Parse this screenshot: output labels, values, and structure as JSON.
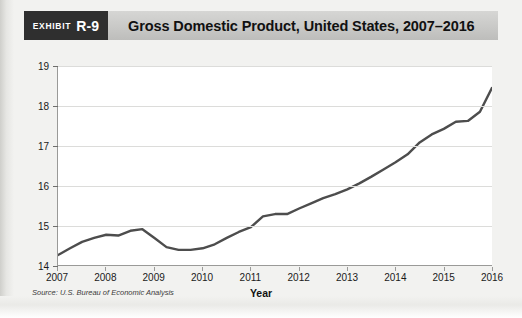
{
  "exhibit": {
    "tag_word": "Exhibit",
    "tag_number": "R-9",
    "title": "Gross Domestic Product, United States, 2007–2016"
  },
  "source_note": "Source: U.S. Bureau of Economic Analysis",
  "colors": {
    "banner_bg": "#c9c9c7",
    "tag_bg": "#2f2f2f",
    "tag_text": "#ffffff",
    "line": "#4d4d4d",
    "grid": "#dcdcda",
    "plot_bg": "#ffffff",
    "page_bg": "#f2f2f0"
  },
  "chart_data": {
    "type": "line",
    "title": "Gross Domestic Product, United States, 2007–2016",
    "xlabel": "Year",
    "ylabel": "Trillions of Dollars",
    "xlim": [
      2007,
      2016
    ],
    "ylim": [
      14,
      19
    ],
    "yticks": [
      14,
      15,
      16,
      17,
      18,
      19
    ],
    "xticks": [
      2007,
      2008,
      2009,
      2010,
      2011,
      2012,
      2013,
      2014,
      2015,
      2016
    ],
    "grid": true,
    "legend": null,
    "series": [
      {
        "name": "Gross Domestic Product",
        "units": "Trillions of Dollars",
        "x": [
          2007.0,
          2007.25,
          2007.5,
          2007.75,
          2008.0,
          2008.25,
          2008.5,
          2008.75,
          2009.0,
          2009.25,
          2009.5,
          2009.75,
          2010.0,
          2010.25,
          2010.5,
          2010.75,
          2011.0,
          2011.25,
          2011.5,
          2011.75,
          2012.0,
          2012.25,
          2012.5,
          2012.75,
          2013.0,
          2013.25,
          2013.5,
          2013.75,
          2014.0,
          2014.25,
          2014.5,
          2014.75,
          2015.0,
          2015.25,
          2015.5,
          2015.75,
          2016.0
        ],
        "values": [
          14.25,
          14.42,
          14.58,
          14.68,
          14.76,
          14.74,
          14.86,
          14.9,
          14.68,
          14.45,
          14.38,
          14.38,
          14.42,
          14.52,
          14.68,
          14.83,
          14.95,
          15.22,
          15.28,
          15.28,
          15.42,
          15.55,
          15.68,
          15.78,
          15.9,
          16.05,
          16.22,
          16.4,
          16.58,
          16.78,
          17.08,
          17.28,
          17.42,
          17.6,
          17.62,
          17.85,
          18.45
        ]
      }
    ],
    "annotations": []
  }
}
